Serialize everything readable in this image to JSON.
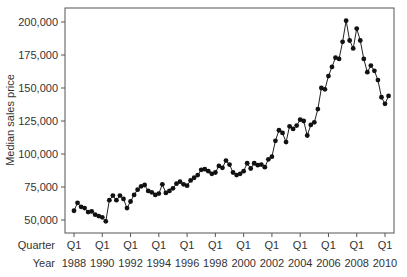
{
  "chart_data": {
    "type": "line",
    "title": "",
    "xlabel": "",
    "ylabel": "Median sales price",
    "x_row_labels": [
      "Quarter",
      "Year"
    ],
    "x_ticks": [
      {
        "quarter": "Q1",
        "year": "1988"
      },
      {
        "quarter": "Q1",
        "year": "1990"
      },
      {
        "quarter": "Q1",
        "year": "1992"
      },
      {
        "quarter": "Q1",
        "year": "1994"
      },
      {
        "quarter": "Q1",
        "year": "1996"
      },
      {
        "quarter": "Q1",
        "year": "1998"
      },
      {
        "quarter": "Q1",
        "year": "2000"
      },
      {
        "quarter": "Q1",
        "year": "2002"
      },
      {
        "quarter": "Q1",
        "year": "2004"
      },
      {
        "quarter": "Q1",
        "year": "2006"
      },
      {
        "quarter": "Q1",
        "year": "2008"
      },
      {
        "quarter": "Q1",
        "year": "2010"
      }
    ],
    "y_ticks": [
      "50,000",
      "75,000",
      "100,000",
      "125,000",
      "150,000",
      "175,000",
      "200,000"
    ],
    "ylim": [
      40000,
      210000
    ],
    "grid": false,
    "legend": null,
    "marker": "filled-circle",
    "series": [
      {
        "name": "Median sales price",
        "start": "1988 Q1",
        "frequency": "quarterly",
        "values": [
          57000,
          63000,
          60000,
          59000,
          56000,
          56500,
          54000,
          53000,
          52000,
          49000,
          65000,
          68500,
          65000,
          68500,
          66000,
          59000,
          64000,
          69000,
          73000,
          75500,
          76500,
          72000,
          71000,
          69000,
          70000,
          77000,
          70500,
          72000,
          74000,
          77500,
          79000,
          77000,
          76000,
          80000,
          82000,
          84000,
          88000,
          88500,
          87000,
          85000,
          86000,
          91000,
          89500,
          95000,
          92000,
          86000,
          84000,
          85000,
          87000,
          93000,
          89000,
          93000,
          91500,
          92000,
          90000,
          96000,
          98000,
          110000,
          118000,
          116000,
          109000,
          121000,
          119000,
          121500,
          126000,
          125000,
          114000,
          122000,
          124000,
          134000,
          150000,
          149000,
          159000,
          166000,
          173000,
          172000,
          185000,
          201000,
          186000,
          180000,
          195000,
          186000,
          172000,
          162000,
          167000,
          163000,
          156000,
          143000,
          138000,
          144000
        ]
      }
    ]
  }
}
